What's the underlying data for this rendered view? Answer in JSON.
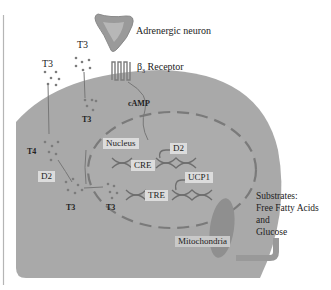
{
  "diagram": {
    "type": "cell-signaling-diagram",
    "labels": {
      "adrenergic_neuron": "Adrenergic neuron",
      "receptor_beta": "β",
      "receptor_sub": "3",
      "receptor_rest": " Receptor",
      "camp": "cAMP",
      "nucleus": "Nucleus",
      "cre": "CRE",
      "tre": "TRE",
      "d2_nucleus": "D2",
      "ucp1": "UCP1",
      "d2_cytoplasm": "D2",
      "t4": "T4",
      "t3_outside_left": "T3",
      "t3_outside_mid": "T3",
      "t3_inside_upper": "T3",
      "t3_cytoplasm": "T3",
      "t3_nucleus": "T3",
      "mitochondria": "Mitochondria",
      "substrates_line1": "Substrates:",
      "substrates_line2": "Free Fatty Acids",
      "substrates_line3": "and",
      "substrates_line4": "Glucose"
    },
    "colors": {
      "cell_fill": "#a9a9a9",
      "neuron_fill": "#9a9a9a",
      "nucleus_border": "#7a7a7a",
      "mitochondria_fill": "#8f8f8f",
      "dots": "#7c7c7c",
      "dna": "#6e6e6e",
      "left_rule": "#b5b5b5"
    }
  }
}
